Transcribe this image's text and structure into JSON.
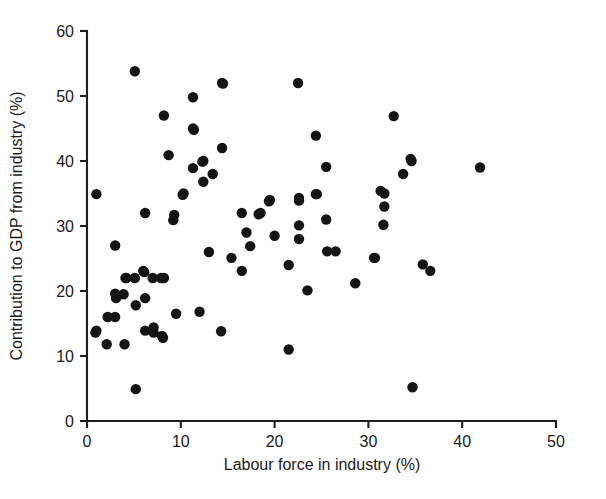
{
  "chart_data": {
    "type": "scatter",
    "title": "",
    "xlabel": "Labour force in industry (%)",
    "ylabel": "Contribution to GDP from industry (%)",
    "xlim": [
      0,
      50
    ],
    "ylim": [
      0,
      60
    ],
    "xticks": [
      0,
      10,
      20,
      30,
      40,
      50
    ],
    "yticks": [
      0,
      10,
      20,
      30,
      40,
      50,
      60
    ],
    "xtick_labels": [
      "0",
      "10",
      "20",
      "30",
      "40",
      "50"
    ],
    "ytick_labels": [
      "0",
      "10",
      "20",
      "30",
      "40",
      "50",
      "60"
    ],
    "grid": false,
    "legend": null,
    "marker": "filled-circle",
    "marker_color": "#141414",
    "marker_size_px": 5.2,
    "n_points": 90,
    "points": [
      [
        1.0,
        34.9
      ],
      [
        1.0,
        13.9
      ],
      [
        0.9,
        13.6
      ],
      [
        2.1,
        11.8
      ],
      [
        2.2,
        16.0
      ],
      [
        3.0,
        27.0
      ],
      [
        3.0,
        16.0
      ],
      [
        3.0,
        19.6
      ],
      [
        3.1,
        18.9
      ],
      [
        3.9,
        19.5
      ],
      [
        4.0,
        11.8
      ],
      [
        4.1,
        22.0
      ],
      [
        4.2,
        22.0
      ],
      [
        5.1,
        53.8
      ],
      [
        5.1,
        22.0
      ],
      [
        5.2,
        17.8
      ],
      [
        5.2,
        4.9
      ],
      [
        6.0,
        23.1
      ],
      [
        6.1,
        22.9
      ],
      [
        6.2,
        32.0
      ],
      [
        6.2,
        18.9
      ],
      [
        6.2,
        13.9
      ],
      [
        7.0,
        22.0
      ],
      [
        7.1,
        14.4
      ],
      [
        7.1,
        13.6
      ],
      [
        7.9,
        22.0
      ],
      [
        8.0,
        13.1
      ],
      [
        8.1,
        12.8
      ],
      [
        8.2,
        47.0
      ],
      [
        8.2,
        22.0
      ],
      [
        8.7,
        40.9
      ],
      [
        9.2,
        30.9
      ],
      [
        9.3,
        31.7
      ],
      [
        10.2,
        34.8
      ],
      [
        10.3,
        35.0
      ],
      [
        11.3,
        49.8
      ],
      [
        11.3,
        45.0
      ],
      [
        11.3,
        38.9
      ],
      [
        11.4,
        44.8
      ],
      [
        12.3,
        39.9
      ],
      [
        12.4,
        40.0
      ],
      [
        12.4,
        36.8
      ],
      [
        13.4,
        38.0
      ],
      [
        14.3,
        13.8
      ],
      [
        14.4,
        52.0
      ],
      [
        14.4,
        42.0
      ],
      [
        14.5,
        51.9
      ],
      [
        15.4,
        25.1
      ],
      [
        16.5,
        32.0
      ],
      [
        16.5,
        23.1
      ],
      [
        17.4,
        26.9
      ],
      [
        18.3,
        31.8
      ],
      [
        18.5,
        32.0
      ],
      [
        19.4,
        33.8
      ],
      [
        19.5,
        34.0
      ],
      [
        21.5,
        24.0
      ],
      [
        21.5,
        11.0
      ],
      [
        22.5,
        52.0
      ],
      [
        22.6,
        33.9
      ],
      [
        22.6,
        30.1
      ],
      [
        22.6,
        28.0
      ],
      [
        22.6,
        34.3
      ],
      [
        23.5,
        20.1
      ],
      [
        24.4,
        43.9
      ],
      [
        24.4,
        34.9
      ],
      [
        24.5,
        34.9
      ],
      [
        25.5,
        39.1
      ],
      [
        25.5,
        31.0
      ],
      [
        25.6,
        26.1
      ],
      [
        26.5,
        26.1
      ],
      [
        28.6,
        21.2
      ],
      [
        30.6,
        25.1
      ],
      [
        30.7,
        25.1
      ],
      [
        31.3,
        35.4
      ],
      [
        31.6,
        30.2
      ],
      [
        31.7,
        35.0
      ],
      [
        31.7,
        33.0
      ],
      [
        32.7,
        46.9
      ],
      [
        33.7,
        38.0
      ],
      [
        34.5,
        40.3
      ],
      [
        34.6,
        40.0
      ],
      [
        34.7,
        5.2
      ],
      [
        35.8,
        24.1
      ],
      [
        36.6,
        23.1
      ],
      [
        41.9,
        39.0
      ],
      [
        20.0,
        28.5
      ],
      [
        17.0,
        29.0
      ],
      [
        13.0,
        26.0
      ],
      [
        12.0,
        16.8
      ],
      [
        9.5,
        16.5
      ]
    ]
  },
  "axes": {
    "x_label": "Labour force in industry (%)",
    "y_label": "Contribution to GDP from industry (%)"
  }
}
